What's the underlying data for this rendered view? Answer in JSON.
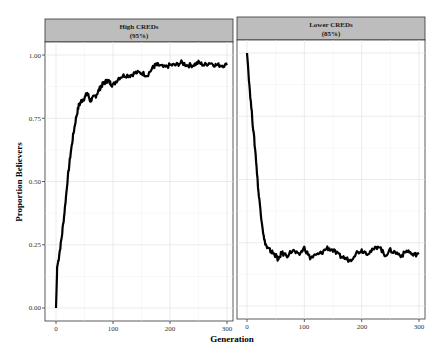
{
  "chart_data": {
    "type": "line",
    "xlabel": "Generation",
    "ylabel": "Proportion Believers",
    "ylim": [
      0,
      1
    ],
    "xlim": [
      0,
      300
    ],
    "y_ticks": [
      "0.00",
      "0.25",
      "0.50",
      "0.75",
      "1.00"
    ],
    "x_ticks": [
      "0",
      "100",
      "200",
      "300"
    ],
    "grid": true,
    "facets": [
      {
        "title": "High CREDs",
        "subtitle": "(95%)",
        "series": {
          "x": [
            0,
            2,
            5,
            10,
            15,
            20,
            25,
            30,
            35,
            40,
            45,
            50,
            55,
            60,
            65,
            70,
            75,
            80,
            85,
            90,
            95,
            100,
            110,
            120,
            130,
            140,
            150,
            160,
            170,
            175,
            180,
            190,
            200,
            210,
            220,
            230,
            240,
            250,
            260,
            270,
            280,
            290,
            300
          ],
          "y": [
            0.0,
            0.16,
            0.2,
            0.28,
            0.38,
            0.5,
            0.6,
            0.68,
            0.75,
            0.8,
            0.82,
            0.83,
            0.85,
            0.82,
            0.83,
            0.84,
            0.86,
            0.88,
            0.89,
            0.9,
            0.89,
            0.88,
            0.91,
            0.92,
            0.92,
            0.93,
            0.93,
            0.92,
            0.95,
            0.96,
            0.96,
            0.95,
            0.96,
            0.96,
            0.97,
            0.96,
            0.96,
            0.97,
            0.96,
            0.97,
            0.96,
            0.96,
            0.96
          ]
        }
      },
      {
        "title": "Lower CREDs",
        "subtitle": "(85%)",
        "series": {
          "x": [
            0,
            5,
            10,
            15,
            20,
            25,
            30,
            35,
            40,
            45,
            50,
            55,
            60,
            70,
            80,
            90,
            100,
            110,
            120,
            130,
            140,
            150,
            160,
            170,
            180,
            190,
            200,
            210,
            220,
            230,
            240,
            250,
            260,
            270,
            280,
            290,
            300
          ],
          "y": [
            1.0,
            0.85,
            0.72,
            0.6,
            0.45,
            0.35,
            0.26,
            0.23,
            0.22,
            0.21,
            0.2,
            0.18,
            0.21,
            0.2,
            0.22,
            0.2,
            0.23,
            0.19,
            0.2,
            0.21,
            0.23,
            0.22,
            0.2,
            0.19,
            0.18,
            0.21,
            0.22,
            0.21,
            0.22,
            0.24,
            0.2,
            0.22,
            0.21,
            0.2,
            0.22,
            0.2,
            0.21
          ]
        }
      }
    ]
  },
  "labels": {
    "panel1_title": "High CREDs",
    "panel1_sub": "(95%)",
    "panel2_title": "Lower CREDs",
    "panel2_sub": "(85%)",
    "xlabel": "Generation",
    "ylabel": "Proportion Believers",
    "y0": "0.00",
    "y1": "0.25",
    "y2": "0.50",
    "y3": "0.75",
    "y4": "1.00",
    "x0": "0",
    "x1": "100",
    "x2": "200",
    "x3": "300"
  }
}
